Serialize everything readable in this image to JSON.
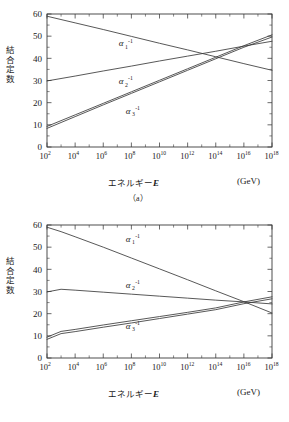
{
  "figure": {
    "axis_y_label": "結合定数",
    "axis_x_label_jp": "エネルギー",
    "axis_x_label_sym": "E",
    "unit_label": "(GeV)",
    "line_color": "#3a3a3a",
    "background": "#ffffff"
  },
  "panels": [
    {
      "caption": "（a）",
      "chart_data": {
        "type": "line",
        "title": "",
        "subtitle": "",
        "xlabel": "エネルギー E (GeV)",
        "ylabel": "結合定数",
        "xscale": "log10",
        "xlim": [
          2,
          18
        ],
        "ylim": [
          0,
          60
        ],
        "xticks": [
          2,
          4,
          6,
          8,
          10,
          12,
          14,
          16,
          18
        ],
        "xtick_labels": [
          "10²",
          "10⁴",
          "10⁶",
          "10⁸",
          "10¹⁰",
          "10¹²",
          "10¹⁴",
          "10¹⁶",
          "10¹⁸"
        ],
        "xtick_bases": [
          "10",
          "10",
          "10",
          "10",
          "10",
          "10",
          "10",
          "10",
          "10"
        ],
        "xtick_exponents": [
          "2",
          "4",
          "6",
          "8",
          "10",
          "12",
          "14",
          "16",
          "18"
        ],
        "yticks": [
          0,
          10,
          20,
          30,
          40,
          50,
          60
        ],
        "ytick_labels": [
          "0",
          "10",
          "20",
          "30",
          "40",
          "50",
          "60"
        ],
        "grid": false,
        "legend": "inline-annotations",
        "series": [
          {
            "name": "α₁⁻¹",
            "label_base": "α",
            "label_sub": "1",
            "label_sup": "-1",
            "label_x": 7.1,
            "label_y": 45.4,
            "x": [
              2,
              4,
              6,
              8,
              10,
              12,
              14,
              16,
              18
            ],
            "values": [
              59.0,
              56.0,
              53.0,
              49.9,
              46.8,
              43.8,
              40.7,
              37.6,
              34.6
            ]
          },
          {
            "name": "α₂⁻¹",
            "label_base": "α",
            "label_sub": "2",
            "label_sup": "-1",
            "label_x": 7.1,
            "label_y": 28.4,
            "x": [
              2,
              4,
              6,
              8,
              10,
              12,
              14,
              16,
              18
            ],
            "values": [
              29.8,
              32.0,
              34.3,
              36.5,
              38.8,
              41.0,
              43.2,
              45.5,
              47.7
            ]
          },
          {
            "name": "α₃⁻¹",
            "label_base": "α",
            "label_sub": "3",
            "label_sup": "-1",
            "label_x": 7.6,
            "label_y": 15.0,
            "band": true,
            "x": [
              2,
              4,
              6,
              8,
              10,
              12,
              14,
              16,
              18
            ],
            "values": [
              9.3,
              14.5,
              19.7,
              24.9,
              30.1,
              35.3,
              40.5,
              45.7,
              50.6
            ],
            "values_lower": [
              8.4,
              13.7,
              19.0,
              24.2,
              29.4,
              34.6,
              39.8,
              45.0,
              49.6
            ]
          }
        ]
      }
    },
    {
      "caption": "",
      "chart_data": {
        "type": "line",
        "title": "",
        "subtitle": "",
        "xlabel": "エネルギー E (GeV)",
        "ylabel": "結合定数",
        "xscale": "log10",
        "xlim": [
          2,
          18
        ],
        "ylim": [
          0,
          60
        ],
        "xticks": [
          2,
          4,
          6,
          8,
          10,
          12,
          14,
          16,
          18
        ],
        "xtick_labels": [
          "10²",
          "10⁴",
          "10⁶",
          "10⁸",
          "10¹⁰",
          "10¹²",
          "10¹⁴",
          "10¹⁶",
          "10¹⁸"
        ],
        "xtick_bases": [
          "10",
          "10",
          "10",
          "10",
          "10",
          "10",
          "10",
          "10",
          "10"
        ],
        "xtick_exponents": [
          "2",
          "4",
          "6",
          "8",
          "10",
          "12",
          "14",
          "16",
          "18"
        ],
        "yticks": [
          0,
          10,
          20,
          30,
          40,
          50,
          60
        ],
        "ytick_labels": [
          "0",
          "10",
          "20",
          "30",
          "40",
          "50",
          "60"
        ],
        "grid": false,
        "legend": "inline-annotations",
        "series": [
          {
            "name": "α₁⁻¹",
            "label_base": "α",
            "label_sub": "1",
            "label_sup": "-1",
            "label_x": 7.6,
            "label_y": 52.5,
            "x": [
              2,
              3,
              4,
              6,
              8,
              10,
              12,
              14,
              16,
              18
            ],
            "values": [
              59.0,
              57.0,
              54.7,
              50.0,
              45.1,
              40.2,
              35.3,
              30.3,
              25.4,
              20.3
            ]
          },
          {
            "name": "α₂⁻¹",
            "label_base": "α",
            "label_sub": "2",
            "label_sup": "-1",
            "label_x": 7.6,
            "label_y": 31.8,
            "x": [
              2,
              3,
              4,
              6,
              8,
              10,
              12,
              14,
              16,
              18
            ],
            "values": [
              29.8,
              31.0,
              30.6,
              29.7,
              28.8,
              27.9,
              27.0,
              26.1,
              25.3,
              24.4
            ]
          },
          {
            "name": "α₃⁻¹",
            "label_base": "α",
            "label_sub": "3",
            "label_sup": "-1",
            "label_x": 7.6,
            "label_y": 13.2,
            "band": true,
            "x": [
              2,
              3,
              4,
              6,
              8,
              10,
              12,
              14,
              16,
              18
            ],
            "values": [
              9.4,
              12.0,
              12.9,
              14.9,
              16.8,
              18.7,
              20.6,
              22.6,
              25.3,
              27.6
            ],
            "values_lower": [
              8.4,
              11.0,
              11.9,
              13.9,
              15.8,
              17.8,
              19.8,
              21.8,
              24.5,
              26.7
            ]
          }
        ]
      }
    }
  ]
}
